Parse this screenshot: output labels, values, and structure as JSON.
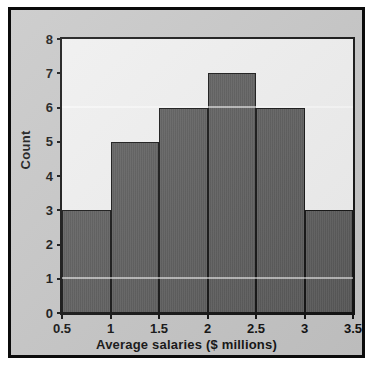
{
  "chart_data": {
    "type": "bar",
    "title": "",
    "xlabel": "Average salaries ($ millions)",
    "ylabel": "Count",
    "categories": [
      "0.5-1",
      "1-1.5",
      "1.5-2",
      "2-2.5",
      "2.5-3",
      "3-3.5"
    ],
    "bin_edges": [
      0.5,
      1,
      1.5,
      2,
      2.5,
      3,
      3.5
    ],
    "values": [
      3,
      5,
      6,
      7,
      6,
      3
    ],
    "xlim": [
      0.5,
      3.5
    ],
    "ylim": [
      0,
      8
    ],
    "x_ticks": [
      "0.5",
      "1",
      "1.5",
      "2",
      "2.5",
      "3",
      "3.5"
    ],
    "x_tick_values": [
      0.5,
      1,
      1.5,
      2,
      2.5,
      3,
      3.5
    ],
    "y_ticks": [
      "0",
      "1",
      "2",
      "3",
      "4",
      "5",
      "6",
      "7",
      "8"
    ],
    "y_tick_values": [
      0,
      1,
      2,
      3,
      4,
      5,
      6,
      7,
      8
    ],
    "grid": false,
    "legend": false,
    "bar_color": "#5a5a5a",
    "bar_edge_color": "#121212",
    "plot_background": "#f0f0f0",
    "frame_background": "#c6c6c6",
    "frame_border_color": "#0b0b0b"
  }
}
